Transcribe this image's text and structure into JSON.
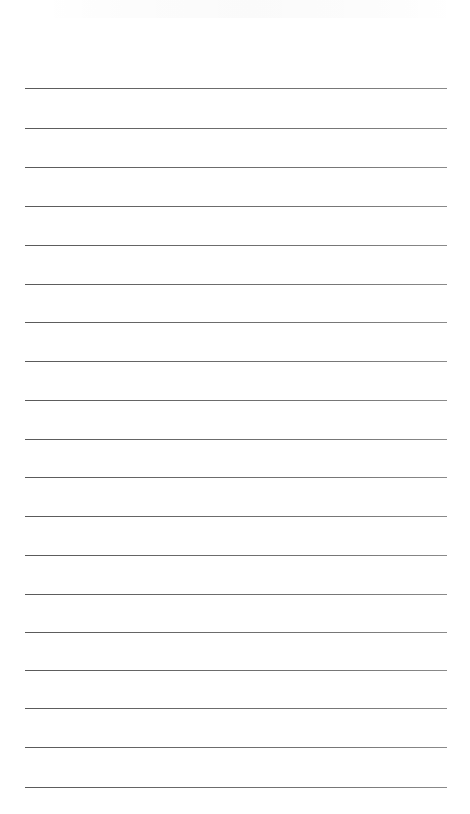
{
  "sheet": {
    "type": "lined-paper",
    "background_color": "#ffffff",
    "line_color": "#666666",
    "line_count": 19,
    "line_left": 25,
    "line_width": 422,
    "lines": [
      {
        "y": 88
      },
      {
        "y": 128
      },
      {
        "y": 167
      },
      {
        "y": 206
      },
      {
        "y": 245
      },
      {
        "y": 284
      },
      {
        "y": 322
      },
      {
        "y": 361
      },
      {
        "y": 400
      },
      {
        "y": 439
      },
      {
        "y": 477
      },
      {
        "y": 516
      },
      {
        "y": 555
      },
      {
        "y": 594
      },
      {
        "y": 632
      },
      {
        "y": 670
      },
      {
        "y": 708
      },
      {
        "y": 747
      },
      {
        "y": 787
      }
    ]
  }
}
